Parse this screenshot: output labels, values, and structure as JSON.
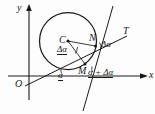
{
  "figure": {
    "type": "geometry-diagram",
    "axes": {
      "x_label": "x",
      "y_label": "y",
      "origin_label": "O"
    },
    "points": [
      {
        "id": "C",
        "label": "C",
        "role": "circle-center"
      },
      {
        "id": "N",
        "label": "N",
        "role": "point-on-circle"
      },
      {
        "id": "M",
        "label": "M",
        "role": "point-on-circle"
      }
    ],
    "lines": [
      {
        "id": "T",
        "label": "T",
        "role": "tangent-line"
      },
      {
        "id": "normal",
        "label": "",
        "role": "secant-line"
      }
    ],
    "angles": [
      {
        "id": "alpha-axis",
        "label": "α",
        "role": "angle-at-x-axis"
      },
      {
        "id": "delta-alpha-center",
        "label": "Δα",
        "role": "angle-at-center"
      },
      {
        "id": "delta-alpha-tangent",
        "label": "Δα",
        "role": "angle-at-tangent"
      },
      {
        "id": "alpha-plus-delta-alpha",
        "label": "α + Δα",
        "role": "angle-at-M"
      }
    ],
    "colors": {
      "stroke": "#1a1a1a",
      "background": "#fdfdfd"
    }
  }
}
